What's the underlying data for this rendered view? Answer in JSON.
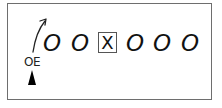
{
  "diagram": {
    "type": "football-play",
    "players_o": [
      {
        "label": "O",
        "x": 43
      },
      {
        "label": "O",
        "x": 71
      },
      {
        "label": "O",
        "x": 126
      },
      {
        "label": "O",
        "x": 153
      },
      {
        "label": "O",
        "x": 181
      }
    ],
    "center": {
      "label": "X"
    },
    "highlighted_player": {
      "label": "OE"
    },
    "route": {
      "direction": "up-right",
      "arrow": true
    },
    "marker": {
      "shape": "triangle",
      "color": "#000000"
    },
    "border_color": "#6e6e6e"
  }
}
